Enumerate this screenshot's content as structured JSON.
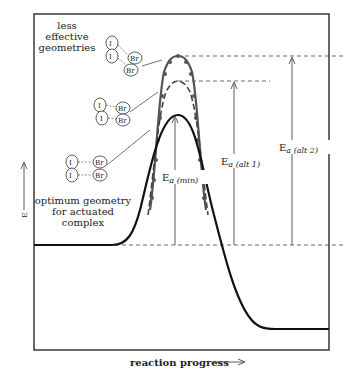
{
  "diagram": {
    "y_axis_label": "E",
    "x_axis_label": "reaction progress",
    "annotations": {
      "less_effective": [
        "less",
        "effective",
        "geometries"
      ],
      "optimum": [
        "optimum geometry",
        "for actuated",
        "complex"
      ]
    },
    "molecules": [
      {
        "id": "alt2",
        "atoms_left": [
          "I",
          "I"
        ],
        "atoms_right": [
          "Br",
          "Br"
        ],
        "arrangement": "skewed, far"
      },
      {
        "id": "alt1",
        "atoms_left": [
          "I",
          "I"
        ],
        "atoms_right": [
          "Br",
          "Br"
        ],
        "arrangement": "tilted"
      },
      {
        "id": "min",
        "atoms_left": [
          "I",
          "I"
        ],
        "atoms_right": [
          "Br",
          "Br"
        ],
        "arrangement": "parallel aligned"
      }
    ],
    "energy_labels": {
      "min": {
        "main": "E",
        "sub": "a (min)"
      },
      "alt1": {
        "main": "E",
        "sub": "a (alt 1)"
      },
      "alt2": {
        "main": "E",
        "sub": "a (alt 2)"
      }
    },
    "curves": [
      {
        "name": "optimum (solid)",
        "style": "solid",
        "peak_relative": 1.0
      },
      {
        "name": "alt 1 (dashed)",
        "style": "dashed",
        "peak_relative": 1.27
      },
      {
        "name": "alt 2 (beaded)",
        "style": "dotted-beaded",
        "peak_relative": 1.46
      }
    ],
    "levels": {
      "reactants": "high baseline",
      "products": "lower baseline"
    },
    "colors": {
      "line": "#1a1a1a",
      "beaded": "#555555",
      "background": "#ffffff"
    }
  }
}
